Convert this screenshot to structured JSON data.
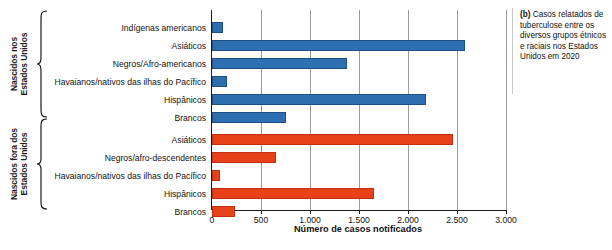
{
  "chart_data": {
    "type": "bar",
    "orientation": "horizontal",
    "title": "",
    "xlabel": "Número de casos notificados",
    "ylabel": "",
    "xlim": [
      0,
      3000
    ],
    "xticks": [
      0,
      500,
      1000,
      1500,
      2000,
      2500,
      3000
    ],
    "xtick_labels": [
      "0",
      "500",
      "1.000",
      "1.500",
      "2.000",
      "2.500",
      "3.000"
    ],
    "grid": true,
    "legend": "none",
    "groups": [
      {
        "name": "Nascidos nos Estados Unidos",
        "color": "#2e6fb0",
        "color_name": "blue",
        "categories": [
          "Indígenas americanos",
          "Asiáticos",
          "Negros/Afro-americanos",
          "Havaianos/nativos das ilhas do Pacífico",
          "Hispânicos",
          "Brancos"
        ],
        "values": [
          110,
          2580,
          1380,
          150,
          2180,
          755
        ]
      },
      {
        "name": "Nascidos fora dos Estados Unidos",
        "color": "#e8411a",
        "color_name": "red",
        "categories": [
          "Asiáticos",
          "Negros/afro-descendentes",
          "Havaianos/nativos das ilhas do Pacífico",
          "Hispânicos",
          "Brancos"
        ],
        "values": [
          2460,
          655,
          80,
          1655,
          235
        ]
      }
    ]
  },
  "axis": {
    "group_label_born_us": "Nascidos nos Estados Unidos",
    "group_label_born_outside": "Nascidos fora dos Estados Unidos",
    "xtitle": "Número de casos notificados",
    "ticks": [
      "0",
      "500",
      "1.000",
      "1.500",
      "2.000",
      "2.500",
      "3.000"
    ]
  },
  "categories": {
    "us": [
      "Indígenas americanos",
      "Asiáticos",
      "Negros/Afro-americanos",
      "Havaianos/nativos das ilhas do Pacífico",
      "Hispânicos",
      "Brancos"
    ],
    "outside": [
      "Asiáticos",
      "Negros/afro-descendentes",
      "Havaianos/nativos das ilhas do Pacífico",
      "Hispânicos",
      "Brancos"
    ]
  },
  "caption": {
    "marker": "(b)",
    "text": " Casos relatados de tuberculose entre os diversos grupos étnicos e raciais nos Estados Unidos em 2020"
  },
  "colors": {
    "blue": "#2e6fb0",
    "red": "#e8411a",
    "grid": "#9a9a9a",
    "axis": "#1a1a1a"
  }
}
